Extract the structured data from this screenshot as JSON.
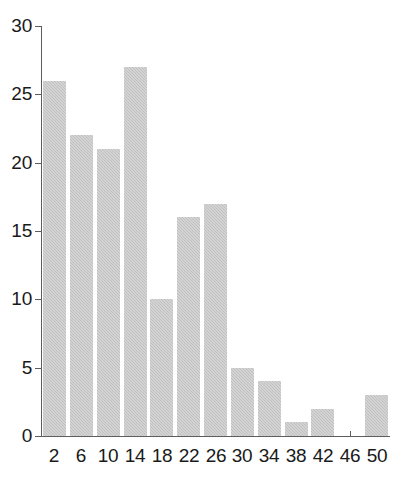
{
  "chart_data": {
    "type": "bar",
    "title": "",
    "subtitle": "",
    "xlabel": "",
    "ylabel": "",
    "categories": [
      "2",
      "6",
      "10",
      "14",
      "18",
      "22",
      "26",
      "30",
      "34",
      "38",
      "42",
      "46",
      "50"
    ],
    "x_tick_labels": [
      "2",
      "6",
      "10",
      "14",
      "18",
      "22",
      "26",
      "30",
      "34",
      "38",
      "42",
      "46",
      "50"
    ],
    "y_tick_labels": [
      "0",
      "5",
      "10",
      "15",
      "20",
      "25",
      "30"
    ],
    "y_ticks": [
      0,
      5,
      10,
      15,
      20,
      25,
      30
    ],
    "ylim": [
      0,
      30
    ],
    "xlim": [
      0,
      52
    ],
    "grid": false,
    "legend": false,
    "bar_color": "#c0c0c0",
    "axis_color": "#5d5d5d",
    "bin_width": 4,
    "bars": [
      {
        "label": "2",
        "bin_start": 0,
        "bin_end": 4,
        "value": 26
      },
      {
        "label": "6",
        "bin_start": 4,
        "bin_end": 8,
        "value": 22
      },
      {
        "label": "10",
        "bin_start": 8,
        "bin_end": 12,
        "value": 21
      },
      {
        "label": "14",
        "bin_start": 12,
        "bin_end": 16,
        "value": 27
      },
      {
        "label": "18",
        "bin_start": 16,
        "bin_end": 20,
        "value": 10
      },
      {
        "label": "22",
        "bin_start": 20,
        "bin_end": 24,
        "value": 16
      },
      {
        "label": "26",
        "bin_start": 24,
        "bin_end": 28,
        "value": 17
      },
      {
        "label": "30",
        "bin_start": 28,
        "bin_end": 32,
        "value": 5
      },
      {
        "label": "34",
        "bin_start": 32,
        "bin_end": 36,
        "value": 4
      },
      {
        "label": "38",
        "bin_start": 36,
        "bin_end": 40,
        "value": 1
      },
      {
        "label": "42",
        "bin_start": 40,
        "bin_end": 44,
        "value": 2
      },
      {
        "label": "46",
        "bin_start": 44,
        "bin_end": 48,
        "value": 0
      },
      {
        "label": "50",
        "bin_start": 48,
        "bin_end": 52,
        "value": 3
      }
    ],
    "values": [
      26,
      22,
      21,
      27,
      10,
      16,
      17,
      5,
      4,
      1,
      2,
      0,
      3
    ]
  }
}
